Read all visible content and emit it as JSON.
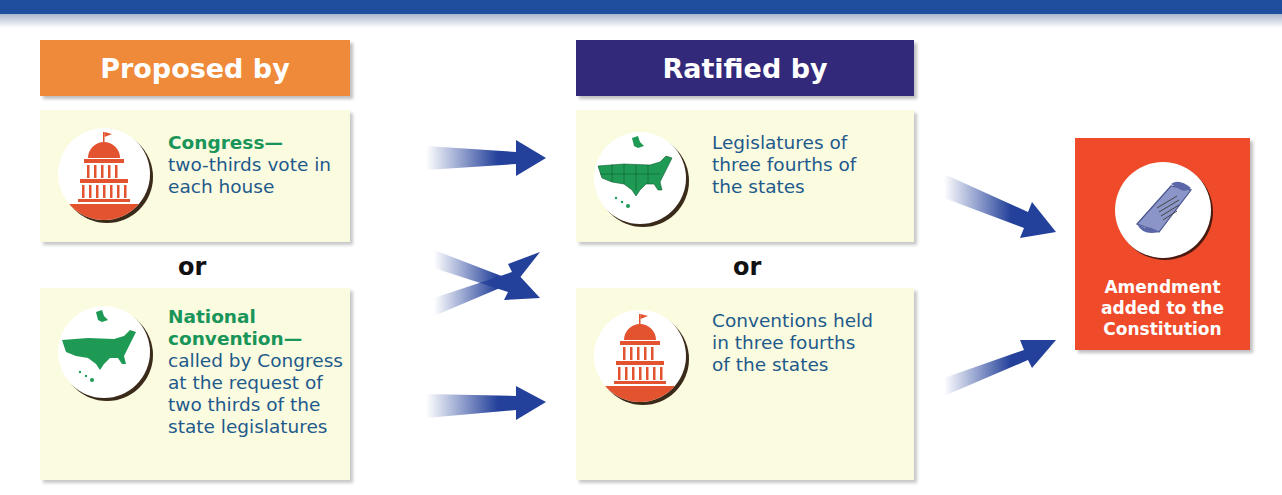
{
  "banner": {
    "color": "#1f4e9e"
  },
  "columns": {
    "proposed": {
      "header": "Proposed by",
      "header_color": "#ef8a3a",
      "options": [
        {
          "lead": "Congress—",
          "text_lines": [
            "two-thirds vote in",
            "each house"
          ],
          "icon": "capitol-building-icon"
        },
        {
          "lead_lines": [
            "National",
            "convention—"
          ],
          "text_lines": [
            "called by Congress",
            "at the request of",
            "two thirds of the",
            "state legislatures"
          ],
          "icon": "us-map-icon"
        }
      ],
      "separator": "or"
    },
    "ratified": {
      "header": "Ratified by",
      "header_color": "#33297a",
      "options": [
        {
          "text_lines": [
            "Legislatures of",
            "three fourths of",
            "the states"
          ],
          "icon": "us-states-map-icon"
        },
        {
          "text_lines": [
            "Conventions held",
            "in three fourths",
            "of the states"
          ],
          "icon": "capitol-building-icon"
        }
      ],
      "separator": "or"
    }
  },
  "result": {
    "lines": [
      "Amendment",
      "added to the",
      "Constitution"
    ],
    "icon": "scroll-document-icon",
    "color": "#ef4b2a"
  },
  "colors": {
    "card_bg": "#fbfbdf",
    "lead_green": "#19955a",
    "body_blue": "#1e5a8c",
    "arrow_blue": "#23409a"
  }
}
